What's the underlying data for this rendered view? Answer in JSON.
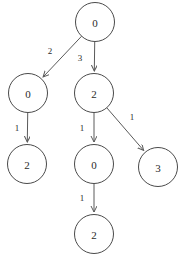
{
  "diagram": {
    "type": "directed-tree",
    "title": "",
    "background_color": "#ffffff",
    "node_stroke_color": "#4a4a4a",
    "node_fill_color": "#ffffff",
    "edge_color": "#5a5a5a",
    "text_color": "#2b2b2b",
    "node_radius": 19.5,
    "nodes": [
      {
        "id": "root",
        "label": "0",
        "cx": 95,
        "cy": 22
      },
      {
        "id": "left",
        "label": "0",
        "cx": 28,
        "cy": 93
      },
      {
        "id": "mid",
        "label": "2",
        "cx": 94,
        "cy": 93
      },
      {
        "id": "leftleaf",
        "label": "2",
        "cx": 27,
        "cy": 164
      },
      {
        "id": "midchild",
        "label": "0",
        "cx": 94,
        "cy": 164
      },
      {
        "id": "rightleaf",
        "label": "3",
        "cx": 158,
        "cy": 167
      },
      {
        "id": "bottom",
        "label": "2",
        "cx": 94,
        "cy": 234
      }
    ],
    "edges": [
      {
        "id": "root-left",
        "from": "root",
        "to": "left",
        "label": "2",
        "label_x": 50,
        "label_y": 51
      },
      {
        "id": "root-mid",
        "from": "root",
        "to": "mid",
        "label": "3",
        "label_x": 80,
        "label_y": 58
      },
      {
        "id": "left-leftleaf",
        "from": "left",
        "to": "leftleaf",
        "label": "1",
        "label_x": 17,
        "label_y": 128
      },
      {
        "id": "mid-midchild",
        "from": "mid",
        "to": "midchild",
        "label": "1",
        "label_x": 82,
        "label_y": 128
      },
      {
        "id": "mid-rightleaf",
        "from": "mid",
        "to": "rightleaf",
        "label": "1",
        "label_x": 132,
        "label_y": 117
      },
      {
        "id": "midchild-bottom",
        "from": "midchild",
        "to": "bottom",
        "label": "1",
        "label_x": 82,
        "label_y": 198
      }
    ]
  }
}
